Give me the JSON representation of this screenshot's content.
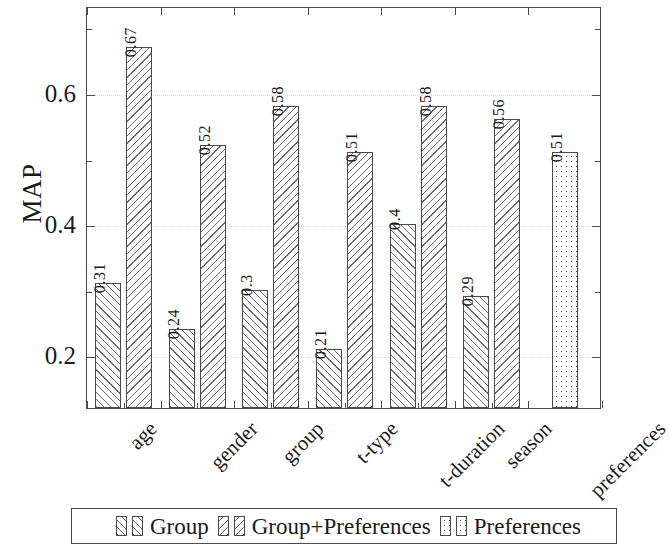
{
  "chart_data": {
    "type": "bar",
    "title": "",
    "xlabel": "",
    "ylabel": "MAP",
    "ylim": [
      0.12,
      0.7325
    ],
    "grid": true,
    "legend_position": "bottom",
    "y_ticks_major": [
      0.2,
      0.4,
      0.6
    ],
    "y_tick_labels": [
      "0.2",
      "0.4",
      "0.6"
    ],
    "y_ticks_minor": [
      0.3,
      0.5,
      0.7
    ],
    "categories": [
      "age",
      "gender",
      "group",
      "t-type",
      "t-duration",
      "season",
      "preferences"
    ],
    "series": [
      {
        "name": "Group",
        "pattern": "hatch-forward-slash",
        "values": [
          0.31,
          0.24,
          0.3,
          0.21,
          0.4,
          0.29,
          null
        ],
        "labels": [
          "0.31",
          "0.24",
          "0.3",
          "0.21",
          "0.4",
          "0.29",
          ""
        ]
      },
      {
        "name": "Group+Preferences",
        "pattern": "hatch-back-slash",
        "values": [
          0.67,
          0.52,
          0.58,
          0.51,
          0.58,
          0.56,
          null
        ],
        "labels": [
          "0.67",
          "0.52",
          "0.58",
          "0.51",
          "0.58",
          "0.56",
          ""
        ]
      },
      {
        "name": "Preferences",
        "pattern": "dots",
        "values": [
          null,
          null,
          null,
          null,
          null,
          null,
          0.51
        ],
        "labels": [
          "",
          "",
          "",
          "",
          "",
          "",
          "0.51"
        ]
      }
    ],
    "colors": {
      "axis": "#4a4a4a",
      "hatch": "#6d6d6d",
      "grid": "#d8d8d8",
      "text": "#1a1a1a",
      "background": "#ffffff"
    }
  },
  "legend": {
    "entries": [
      {
        "label": "Group"
      },
      {
        "label": "Group+Preferences"
      },
      {
        "label": "Preferences"
      }
    ]
  }
}
